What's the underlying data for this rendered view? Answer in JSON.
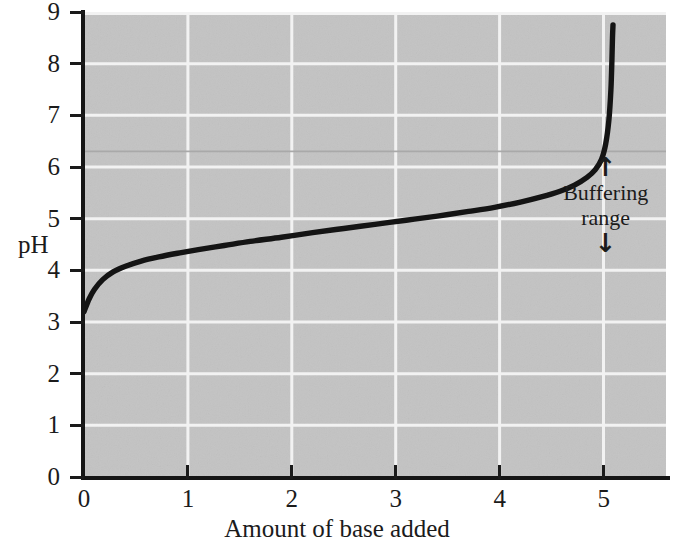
{
  "chart_data": {
    "type": "line",
    "title": "",
    "xlabel": "Amount of base added",
    "ylabel": "pH",
    "xlim": [
      0,
      5.6
    ],
    "ylim": [
      0,
      9
    ],
    "xticks": [
      "0",
      "1",
      "2",
      "3",
      "4",
      "5"
    ],
    "xtick_values": [
      0,
      1,
      2,
      3,
      4,
      5
    ],
    "yticks": [
      "0",
      "1",
      "2",
      "3",
      "4",
      "5",
      "6",
      "7",
      "8",
      "9"
    ],
    "ytick_values": [
      0,
      1,
      2,
      3,
      4,
      5,
      6,
      7,
      8,
      9
    ],
    "grid": true,
    "grid_color": "#ffffff",
    "plot_background": "#c3c3c3",
    "line_color": "#141414",
    "legend": "none",
    "series": [
      {
        "name": "Titration curve",
        "x": [
          0.0,
          0.05,
          0.1,
          0.18,
          0.28,
          0.4,
          0.55,
          0.72,
          0.9,
          1.1,
          1.35,
          1.6,
          1.9,
          2.2,
          2.5,
          2.8,
          3.1,
          3.4,
          3.7,
          3.95,
          4.2,
          4.4,
          4.58,
          4.72,
          4.84,
          4.92,
          4.98,
          5.02,
          5.05,
          5.07,
          5.08,
          5.085,
          5.09
        ],
        "y": [
          3.2,
          3.45,
          3.63,
          3.82,
          3.97,
          4.08,
          4.18,
          4.26,
          4.33,
          4.4,
          4.48,
          4.56,
          4.64,
          4.73,
          4.81,
          4.89,
          4.97,
          5.05,
          5.14,
          5.22,
          5.32,
          5.42,
          5.53,
          5.65,
          5.8,
          5.95,
          6.15,
          6.45,
          6.9,
          7.5,
          8.1,
          8.5,
          8.75
        ]
      }
    ],
    "annotations": [
      {
        "name": "buffering-range",
        "text_line1": "Buffering",
        "text_line2": "range",
        "arrow_up": "↑",
        "arrow_down": "↓",
        "x_position": 5.02,
        "y_top": 6.25,
        "y_bottom": 4.45
      }
    ]
  }
}
